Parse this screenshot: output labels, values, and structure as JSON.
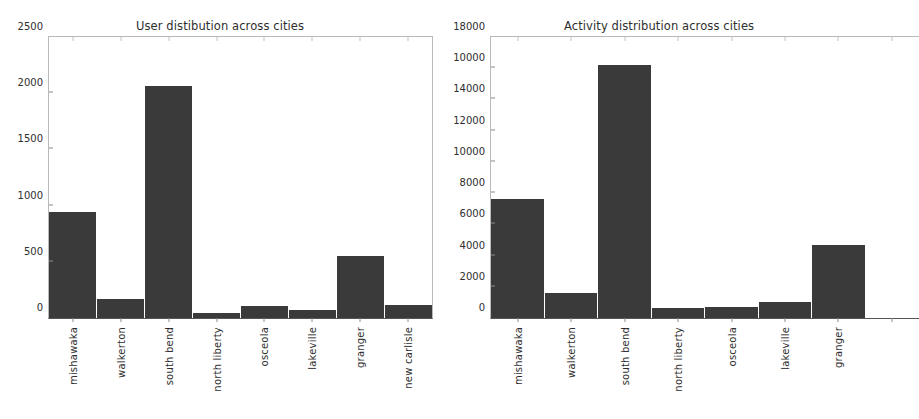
{
  "figure": {
    "background": "#ffffff",
    "bar_color": "#3a3a3a",
    "axis_color": "#b9b9b9",
    "text_color": "#2e2e2e"
  },
  "chart_data": [
    {
      "type": "bar",
      "panel": "left",
      "title": "User distibution across cities",
      "xlabel": "",
      "ylabel": "",
      "categories": [
        "mishawaka",
        "walkerton",
        "south bend",
        "north liberty",
        "osceola",
        "lakeville",
        "granger",
        "new carlisle"
      ],
      "values": [
        940,
        165,
        2065,
        45,
        110,
        70,
        550,
        120
      ],
      "ylim": [
        0,
        2500
      ],
      "yticks": [
        0,
        500,
        1000,
        1500,
        2000,
        2500
      ],
      "ytick_labels": [
        "0",
        "500",
        "1000",
        "1500",
        "2000",
        "2500"
      ],
      "grid": false,
      "legend": "none",
      "clipped": false
    },
    {
      "type": "bar",
      "panel": "right",
      "title": "Activity distribution across cities",
      "xlabel": "",
      "ylabel": "",
      "categories": [
        "mishawaka",
        "walkerton",
        "south bend",
        "north liberty",
        "osceola",
        "lakeville",
        "granger"
      ],
      "values": [
        7600,
        1600,
        16200,
        650,
        720,
        1020,
        4700
      ],
      "ylim": [
        0,
        18000
      ],
      "yticks": [
        0,
        2000,
        4000,
        6000,
        8000,
        10000,
        12000,
        14000,
        16000,
        18000
      ],
      "ytick_labels": [
        "0",
        "2000",
        "4000",
        "6000",
        "8000",
        "10000",
        "12000",
        "14000",
        "10000",
        "18000"
      ],
      "grid": false,
      "legend": "none",
      "clipped": true,
      "clip_note": "right edge of axes cut off by figure boundary; 'new carlisle' category not visible"
    }
  ]
}
